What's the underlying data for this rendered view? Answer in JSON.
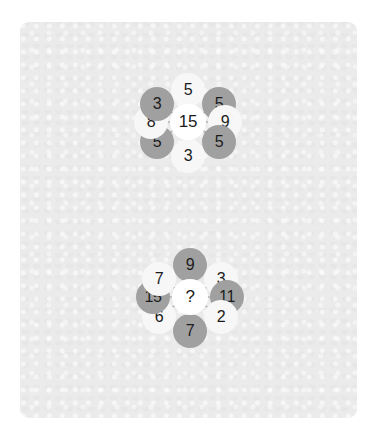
{
  "canvas": {
    "background_color": "#ffffff",
    "panel_color": "#ebebeb"
  },
  "colors": {
    "node_light": "#f7f7f7",
    "node_gray": "#a0a0a0",
    "node_center": "#ffffff",
    "spoke_line": "#b4b4b4",
    "text": "#1c1c1c"
  },
  "puzzles": [
    {
      "id": "hexagon-puzzle-solved",
      "center": {
        "label": "15",
        "style": "center"
      },
      "nodes": [
        {
          "position": "top",
          "label": "5",
          "style": "light",
          "angle": 270
        },
        {
          "position": "top-right",
          "label": "5",
          "style": "gray",
          "angle": 330
        },
        {
          "position": "right",
          "label": "9",
          "style": "light",
          "angle": 0
        },
        {
          "position": "bottom-right",
          "label": "5",
          "style": "gray",
          "angle": 30
        },
        {
          "position": "bottom",
          "label": "3",
          "style": "light",
          "angle": 90
        },
        {
          "position": "bottom-left",
          "label": "5",
          "style": "gray",
          "angle": 150
        },
        {
          "position": "left",
          "label": "8",
          "style": "light",
          "angle": 180
        },
        {
          "position": "top-left",
          "label": "3",
          "style": "gray",
          "angle": 210
        }
      ]
    },
    {
      "id": "hexagon-puzzle-unsolved",
      "center": {
        "label": "?",
        "style": "center"
      },
      "nodes": [
        {
          "position": "top",
          "label": "9",
          "style": "gray",
          "angle": 270
        },
        {
          "position": "top-right",
          "label": "3",
          "style": "light",
          "angle": 330
        },
        {
          "position": "right",
          "label": "11",
          "style": "gray",
          "angle": 0
        },
        {
          "position": "bottom-right",
          "label": "2",
          "style": "light",
          "angle": 30
        },
        {
          "position": "bottom",
          "label": "7",
          "style": "gray",
          "angle": 90
        },
        {
          "position": "bottom-left",
          "label": "6",
          "style": "light",
          "angle": 150
        },
        {
          "position": "left",
          "label": "15",
          "style": "gray",
          "angle": 180
        },
        {
          "position": "top-left",
          "label": "7",
          "style": "light",
          "angle": 210
        }
      ]
    }
  ]
}
